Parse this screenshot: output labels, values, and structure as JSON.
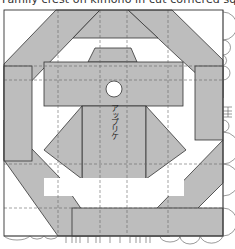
{
  "title": "Family crest on kimono in cut cornered square",
  "label": "アップリケ",
  "colors": {
    "fill": "#bdbdbd",
    "line": "#333333",
    "dash": "#666666",
    "background": "#ffffff"
  }
}
